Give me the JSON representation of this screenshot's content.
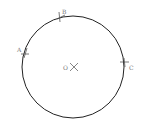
{
  "diagram": {
    "circle": {
      "cx": 73,
      "cy": 67,
      "r": 51,
      "stroke": "#222222"
    },
    "center": {
      "label": "O",
      "x": 73,
      "y": 67
    },
    "points": [
      {
        "label": "A",
        "x": 25,
        "y": 53
      },
      {
        "label": "B",
        "x": 60,
        "y": 17
      },
      {
        "label": "C",
        "x": 125,
        "y": 62
      }
    ]
  }
}
